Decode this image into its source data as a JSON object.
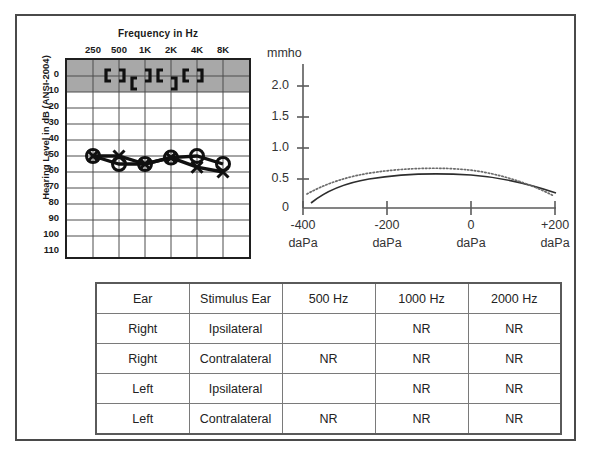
{
  "figure": {
    "caption": ""
  },
  "audiogram": {
    "title": "Frequency in Hz",
    "y_axis_title": "Hearing Level in dB (ANSI-2004)",
    "frequency_labels": [
      "250",
      "500",
      "1K",
      "2K",
      "4K",
      "8K"
    ],
    "db_labels": [
      "0",
      "10",
      "20",
      "30",
      "40",
      "50",
      "60",
      "70",
      "80",
      "90",
      "100",
      "110"
    ],
    "shaded_band": {
      "from_db": -10,
      "to_db": 10,
      "color": "#a8a8a8"
    }
  },
  "tympanogram": {
    "unit_label": "mmho",
    "y_labels": [
      "2.0",
      "1.5",
      "1.0",
      "0.5",
      "0"
    ],
    "x_labels": [
      "-400",
      "-200",
      "0",
      "+200"
    ],
    "x_unit": "daPa"
  },
  "reflex_table": {
    "headers": [
      "Ear",
      "Stimulus Ear",
      "500 Hz",
      "1000 Hz",
      "2000 Hz"
    ],
    "rows": [
      [
        "Right",
        "Ipsilateral",
        "",
        "NR",
        "NR"
      ],
      [
        "Right",
        "Contralateral",
        "NR",
        "NR",
        "NR"
      ],
      [
        "Left",
        "Ipsilateral",
        "",
        "NR",
        "NR"
      ],
      [
        "Left",
        "Contralateral",
        "NR",
        "NR",
        "NR"
      ]
    ]
  },
  "chart_data": [
    {
      "type": "line",
      "name": "audiogram",
      "title": "Frequency in Hz",
      "xlabel": "Frequency in Hz",
      "ylabel": "Hearing Level in dB (ANSI-2004)",
      "x": [
        "250",
        "500",
        "1000",
        "2000",
        "4000",
        "8000"
      ],
      "ylim": [
        -10,
        115
      ],
      "y_inverted": true,
      "grid": true,
      "series": [
        {
          "name": "Right ear air conduction (masked, O with X overlay)",
          "symbol": "circle",
          "values": [
            50,
            55,
            55,
            51,
            50,
            55
          ]
        },
        {
          "name": "Left ear air conduction (X)",
          "symbol": "x",
          "values": [
            50,
            50,
            55,
            51,
            57,
            60
          ]
        },
        {
          "name": "Right ear bone conduction masked (bracket open-right)",
          "symbol": "bracket-right",
          "values": [
            null,
            0,
            5,
            0,
            5,
            null
          ],
          "note": "no-response / masked bone symbols plotted in shaded normal band"
        },
        {
          "name": "Left ear bone conduction masked (bracket open-left)",
          "symbol": "bracket-left",
          "values": [
            null,
            0,
            5,
            5,
            0,
            null
          ]
        }
      ]
    },
    {
      "type": "line",
      "name": "tympanogram",
      "xlabel": "daPa",
      "ylabel": "mmho",
      "xlim": [
        -400,
        200
      ],
      "ylim": [
        0,
        2.2
      ],
      "xticks": [
        -400,
        -200,
        0,
        200
      ],
      "yticks": [
        0,
        0.5,
        1.0,
        1.5,
        2.0
      ],
      "grid": false,
      "series": [
        {
          "name": "Right ear (solid)",
          "style": "solid",
          "x": [
            -390,
            -350,
            -300,
            -250,
            -200,
            -150,
            -100,
            -50,
            0,
            50,
            100,
            150,
            200
          ],
          "y": [
            0.08,
            0.21,
            0.31,
            0.37,
            0.42,
            0.45,
            0.47,
            0.48,
            0.48,
            0.46,
            0.43,
            0.38,
            0.32
          ]
        },
        {
          "name": "Left ear (dotted)",
          "style": "dotted",
          "x": [
            -390,
            -350,
            -300,
            -250,
            -200,
            -150,
            -100,
            -50,
            0,
            50,
            100,
            150,
            200
          ],
          "y": [
            0.22,
            0.32,
            0.4,
            0.46,
            0.5,
            0.53,
            0.55,
            0.55,
            0.53,
            0.48,
            0.42,
            0.35,
            0.26
          ]
        }
      ]
    }
  ]
}
